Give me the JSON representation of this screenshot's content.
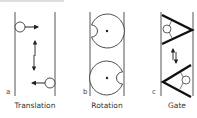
{
  "panels": [
    {
      "letter": "a",
      "caption": "Translation",
      "mechanism": "translation"
    },
    {
      "letter": "b",
      "caption": "Rotation",
      "mechanism": "rotation"
    },
    {
      "letter": "c",
      "caption": "Gate",
      "mechanism": "gate"
    }
  ],
  "colors": {
    "stroke": "#222222",
    "wall": "#555555",
    "topbar": "#dddddd"
  }
}
